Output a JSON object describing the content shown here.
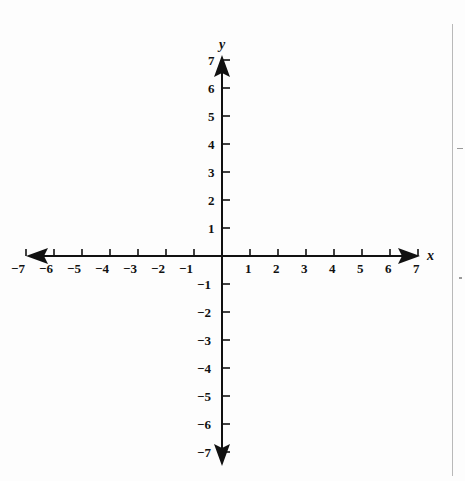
{
  "figure": {
    "kind": "cartesian-coordinate-plane",
    "background_color": "#fdfdfd",
    "axis_color": "#111111",
    "origin_px": {
      "x": 222,
      "y": 256
    },
    "unit_px": 28,
    "x_axis": {
      "name": "x",
      "name_pos": {
        "x": 427,
        "y": 249
      },
      "line_from_px": 26,
      "line_to_px": 420,
      "label_side": "below",
      "tick_side": "above",
      "arrow_left": true,
      "arrow_right": true
    },
    "y_axis": {
      "name": "y",
      "name_pos": {
        "x": 219,
        "y": 38
      },
      "line_from_px": 55,
      "line_to_px": 466,
      "label_side": "left",
      "tick_side": "right",
      "arrow_up": true,
      "arrow_down": true
    },
    "edge_rule": {
      "x": 452,
      "y_from": 24,
      "y_to": 476,
      "color": "#b9b9b9"
    },
    "edge_marks": [
      {
        "x": 457,
        "y": 148,
        "w": 6,
        "h": 1
      },
      {
        "x": 459,
        "y": 277,
        "w": 3,
        "h": 2
      }
    ]
  },
  "chart_data": {
    "type": "line",
    "title": "",
    "subtitle": "",
    "xlabel": "x",
    "ylabel": "y",
    "xlim": [
      -7,
      7
    ],
    "ylim": [
      -7,
      7
    ],
    "grid": false,
    "legend": null,
    "series": [],
    "annotations": [],
    "x_ticks": [
      -7,
      -6,
      -5,
      -4,
      -3,
      -2,
      -1,
      1,
      2,
      3,
      4,
      5,
      6,
      7
    ],
    "y_ticks": [
      7,
      6,
      5,
      4,
      3,
      2,
      1,
      -1,
      -2,
      -3,
      -4,
      -5,
      -6,
      -7
    ],
    "x_tick_labels": [
      "−7",
      "−6",
      "−5",
      "−4",
      "−3",
      "−2",
      "−1",
      "1",
      "2",
      "3",
      "4",
      "5",
      "6",
      "7"
    ],
    "y_tick_labels": [
      "7",
      "6",
      "5",
      "4",
      "3",
      "2",
      "1",
      "−1",
      "−2",
      "−3",
      "−4",
      "−5",
      "−6",
      "−7"
    ]
  }
}
